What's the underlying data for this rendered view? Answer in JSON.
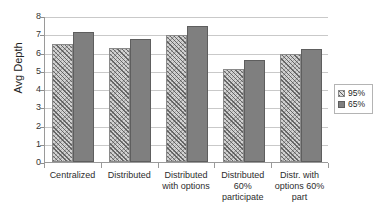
{
  "chart_data": {
    "type": "bar",
    "title": "",
    "xlabel": "",
    "ylabel": "Avg Depth",
    "ylim": [
      0,
      8
    ],
    "ytick_labels": [
      "0",
      "1",
      "2",
      "3",
      "4",
      "5",
      "6",
      "7",
      "8"
    ],
    "grid": true,
    "legend_position": "right",
    "categories": [
      "Centralized",
      "Distributed",
      "Distributed with options",
      "Distributed 60% participate",
      "Distr. with options 60% part"
    ],
    "series": [
      {
        "name": "95%",
        "values": [
          6.45,
          6.25,
          6.95,
          5.1,
          5.9
        ],
        "color": "#d2d2d2",
        "pattern": "diagonal-hatch"
      },
      {
        "name": "65%",
        "values": [
          7.15,
          6.75,
          7.45,
          5.6,
          6.2
        ],
        "color": "#7f7f7f",
        "pattern": "solid"
      }
    ]
  },
  "axis": {
    "y_title": "Avg Depth",
    "y_ticks": [
      "8",
      "7",
      "6",
      "5",
      "4",
      "3",
      "2",
      "1",
      "0"
    ]
  },
  "category_labels": [
    {
      "line1": "Centralized",
      "line2": "",
      "line3": ""
    },
    {
      "line1": "Distributed",
      "line2": "",
      "line3": ""
    },
    {
      "line1": "Distributed",
      "line2": "with options",
      "line3": ""
    },
    {
      "line1": "Distributed",
      "line2": "60%",
      "line3": "participate"
    },
    {
      "line1": "Distr. with",
      "line2": "options 60%",
      "line3": "part"
    }
  ],
  "legend": {
    "items": [
      {
        "label": "95%"
      },
      {
        "label": "65%"
      }
    ]
  },
  "ghost_title": ""
}
